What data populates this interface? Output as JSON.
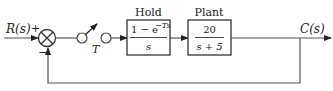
{
  "diagram": {
    "type": "sampled-data feedback control block diagram",
    "input": {
      "label": "R(s)",
      "sign": "+"
    },
    "summing_junction": {
      "inputs": [
        "+",
        "−"
      ]
    },
    "sampler": {
      "label": "T"
    },
    "blocks": [
      {
        "id": "hold",
        "title": "Hold",
        "numerator": "1 − e",
        "exponent": "−Ts",
        "denominator": "s"
      },
      {
        "id": "plant",
        "title": "Plant",
        "numerator": "20",
        "denominator": "s + 5"
      }
    ],
    "output": {
      "label": "C(s)"
    },
    "feedback": {
      "type": "unity",
      "sign": "−"
    }
  }
}
